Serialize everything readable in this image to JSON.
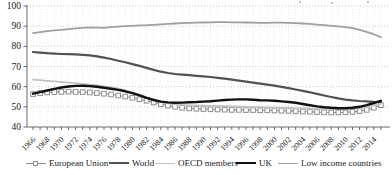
{
  "page": {
    "background": "#ffffff",
    "text_color": "#1a1a1a"
  },
  "chart_data": {
    "type": "line",
    "title": "",
    "xlabel": "",
    "ylabel": "",
    "ylim": [
      40,
      100
    ],
    "y_ticks": [
      40,
      50,
      60,
      70,
      80,
      90,
      100
    ],
    "x": [
      1966,
      1967,
      1968,
      1969,
      1970,
      1971,
      1972,
      1973,
      1974,
      1975,
      1976,
      1977,
      1978,
      1979,
      1980,
      1981,
      1982,
      1983,
      1984,
      1985,
      1986,
      1987,
      1988,
      1989,
      1990,
      1991,
      1992,
      1993,
      1994,
      1995,
      1996,
      1997,
      1998,
      1999,
      2000,
      2001,
      2002,
      2003,
      2004,
      2005,
      2006,
      2007,
      2008,
      2009,
      2010,
      2011,
      2012,
      2013,
      2014,
      2015
    ],
    "x_tick_labels": [
      "1966",
      "1968",
      "1970",
      "1972",
      "1974",
      "1976",
      "1978",
      "1980",
      "1982",
      "1984",
      "1986",
      "1988",
      "1990",
      "1992",
      "1994",
      "1996",
      "1998",
      "2000",
      "2002",
      "2004",
      "2006",
      "2008",
      "2010",
      "2012",
      "2014"
    ],
    "grid": "horizontal dotted at each 10; faint vertical dotted at each year",
    "legend_position": "bottom",
    "series": [
      {
        "name": "European Union",
        "color": "#8f8f8f",
        "line_width": 1.1,
        "marker": "open-square",
        "marker_fill": "#fdfdfd",
        "values": [
          56.3,
          56.8,
          57.1,
          57.3,
          57.4,
          57.5,
          57.4,
          57.3,
          57.1,
          56.8,
          56.5,
          56.1,
          55.6,
          55.1,
          54.5,
          53.8,
          53.0,
          52.2,
          51.3,
          50.6,
          50.0,
          49.5,
          49.2,
          49.0,
          48.9,
          48.8,
          48.7,
          48.6,
          48.5,
          48.5,
          48.4,
          48.4,
          48.3,
          48.3,
          48.2,
          48.1,
          48.0,
          47.9,
          47.7,
          47.6,
          47.4,
          47.3,
          47.2,
          47.2,
          47.3,
          47.5,
          47.9,
          48.5,
          49.5,
          50.8
        ]
      },
      {
        "name": "World",
        "color": "#525252",
        "line_width": 2.2,
        "marker": "none",
        "values": [
          77.2,
          76.9,
          76.6,
          76.4,
          76.2,
          76.1,
          76.0,
          75.8,
          75.5,
          75.0,
          74.4,
          73.7,
          72.9,
          72.1,
          71.2,
          70.3,
          69.3,
          68.3,
          67.4,
          66.8,
          66.3,
          66.0,
          65.7,
          65.4,
          65.1,
          64.8,
          64.4,
          64.0,
          63.5,
          63.0,
          62.5,
          62.0,
          61.5,
          61.0,
          60.5,
          59.9,
          59.3,
          58.6,
          57.9,
          57.2,
          56.4,
          55.6,
          54.9,
          54.2,
          53.6,
          53.2,
          52.9,
          52.7,
          52.5,
          52.4
        ]
      },
      {
        "name": "OECD members",
        "color": "#c2c2c2",
        "line_width": 1.8,
        "marker": "none",
        "values": [
          63.5,
          63.2,
          62.9,
          62.6,
          62.3,
          62.0,
          61.7,
          61.4,
          61.0,
          60.6,
          60.1,
          59.6,
          59.0,
          58.2,
          57.2,
          56.1,
          54.9,
          53.7,
          52.6,
          51.8,
          51.3,
          51.0,
          50.8,
          50.7,
          50.6,
          50.5,
          50.4,
          50.3,
          50.2,
          50.1,
          50.0,
          49.9,
          49.8,
          49.7,
          49.6,
          49.5,
          49.4,
          49.3,
          49.2,
          49.1,
          49.0,
          48.9,
          48.9,
          48.9,
          49.0,
          49.2,
          49.5,
          50.0,
          50.7,
          51.5
        ]
      },
      {
        "name": "UK",
        "color": "#111111",
        "line_width": 2.4,
        "marker": "none",
        "values": [
          56.5,
          57.3,
          58.1,
          58.9,
          59.6,
          60.1,
          60.4,
          60.5,
          60.3,
          60.0,
          59.5,
          59.0,
          58.4,
          57.7,
          56.8,
          55.7,
          54.5,
          53.4,
          52.6,
          52.2,
          52.0,
          52.1,
          52.3,
          52.4,
          52.6,
          52.8,
          53.1,
          53.4,
          53.6,
          53.7,
          53.7,
          53.5,
          53.3,
          53.2,
          53.0,
          52.7,
          52.4,
          52.0,
          51.4,
          50.8,
          50.2,
          49.8,
          49.5,
          49.3,
          49.3,
          49.5,
          50.0,
          50.8,
          51.9,
          53.0
        ]
      },
      {
        "name": "Low income countries",
        "color": "#9f9f9f",
        "line_width": 1.8,
        "marker": "none",
        "values": [
          86.5,
          87.0,
          87.5,
          87.9,
          88.2,
          88.5,
          88.9,
          89.2,
          89.4,
          89.3,
          89.2,
          89.5,
          89.8,
          90.0,
          90.2,
          90.4,
          90.5,
          90.7,
          90.9,
          91.1,
          91.3,
          91.5,
          91.6,
          91.7,
          91.8,
          91.9,
          92.0,
          92.0,
          91.9,
          91.9,
          91.8,
          91.7,
          91.6,
          91.6,
          91.7,
          91.7,
          91.6,
          91.5,
          91.3,
          91.1,
          90.8,
          90.5,
          90.2,
          89.9,
          89.5,
          89.0,
          88.2,
          87.2,
          86.0,
          84.5
        ]
      }
    ],
    "style": {
      "axis_color": "#6b6b6b",
      "grid_color": "#bdbdbd",
      "grid_color_vertical": "#ededed",
      "tick_label_color": "#1a1a1a"
    }
  }
}
